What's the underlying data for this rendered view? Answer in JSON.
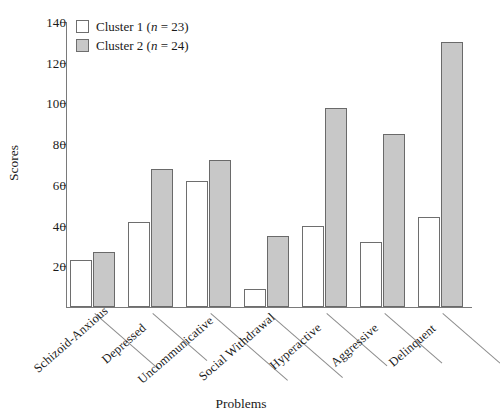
{
  "chart_data": {
    "type": "bar",
    "title": "",
    "xlabel": "Problems",
    "ylabel": "Scores",
    "ylim": [
      0,
      140
    ],
    "yticks": [
      20,
      40,
      60,
      80,
      100,
      120,
      140
    ],
    "grid": false,
    "legend_position": "top-left",
    "categories": [
      "Schizoid-Anxious",
      "Depressed",
      "Uncommunicative",
      "Social Withdrawal",
      "Hyperactive",
      "Aggressive",
      "Delinquent"
    ],
    "series": [
      {
        "name": "Cluster 1",
        "n": 23,
        "legend_label": "Cluster 1 (n = 23)",
        "color": "#ffffff",
        "values": [
          23,
          42,
          62,
          9,
          40,
          32,
          44
        ]
      },
      {
        "name": "Cluster 2",
        "n": 24,
        "legend_label": "Cluster 2 (n = 24)",
        "color": "#c8c8c8",
        "values": [
          27,
          68,
          72,
          35,
          98,
          85,
          130
        ]
      }
    ]
  },
  "legend": {
    "rows": [
      {
        "prefix": "Cluster 1 (",
        "italic": "n",
        "suffix": " = 23)"
      },
      {
        "prefix": "Cluster 2 (",
        "italic": "n",
        "suffix": " = 24)"
      }
    ]
  },
  "axes": {
    "y_title": "Scores",
    "x_title": "Problems",
    "y_tick_labels": [
      "140",
      "120",
      "100",
      "80",
      "60",
      "40",
      "20"
    ]
  }
}
